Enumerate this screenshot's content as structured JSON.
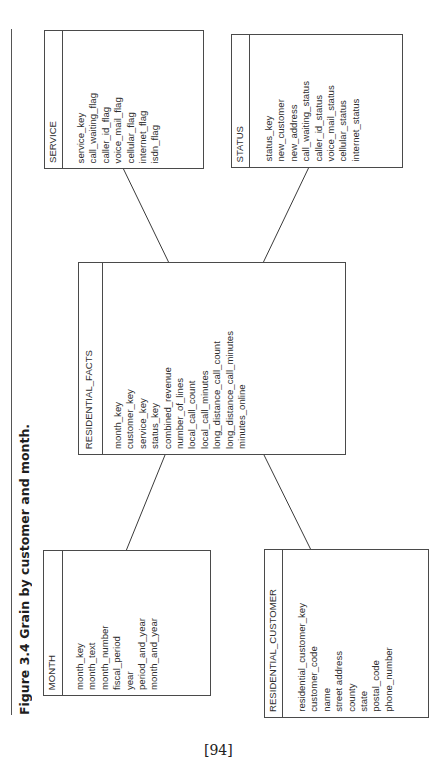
{
  "figure": {
    "title": "Figure 3.4 Grain by customer and month.",
    "page_number": "[94]"
  },
  "entities": {
    "service": {
      "name": "SERVICE",
      "fields": [
        "service_key",
        "call_waiting_flag",
        "caller_id_flag",
        "voice_mail_flag",
        "cellular_flag",
        "internet_flag",
        "isdn_flag"
      ]
    },
    "status": {
      "name": "STATUS",
      "fields": [
        "status_key",
        "new_customer",
        "new_address",
        "call_waiting_status",
        "caller_id_status",
        "voice_mail_status",
        "cellular_status",
        "internet_status"
      ]
    },
    "residential_facts": {
      "name": "RESIDENTIAL_FACTS",
      "fields": [
        "month_key",
        "customer_key",
        "service_key",
        "status_key",
        "combined_revenue",
        "number_of_lines",
        "local_call_count",
        "local_call_minutes",
        "long_distance_call_count",
        "long_distance_call_minutes",
        "minutes_online"
      ]
    },
    "month": {
      "name": "MONTH",
      "fields": [
        "month_key",
        "month_text",
        "month_number",
        "fiscal_period",
        "year",
        "period_and_year",
        "month_and_year"
      ]
    },
    "residential_customer": {
      "name": "RESIDENTIAL_CUSTOMER",
      "fields": [
        "residential_customer_key",
        "customer_code",
        "name",
        "street address",
        "county",
        "state",
        "postal_code",
        "phone_number"
      ]
    }
  },
  "relationships": [
    {
      "from": "residential_facts",
      "to": "service"
    },
    {
      "from": "residential_facts",
      "to": "status"
    },
    {
      "from": "residential_facts",
      "to": "month"
    },
    {
      "from": "residential_facts",
      "to": "residential_customer"
    }
  ]
}
